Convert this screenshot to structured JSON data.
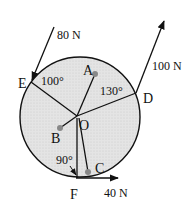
{
  "diagram": {
    "type": "force-diagram",
    "circle": {
      "cx": 80,
      "cy": 117,
      "r": 60,
      "fill": "#e6e6e6",
      "stroke": "#111111"
    },
    "center": {
      "label": "O",
      "x": 77,
      "y": 116
    },
    "points": [
      {
        "id": "A",
        "label": "A",
        "x": 95,
        "y": 74,
        "peg": true
      },
      {
        "id": "B",
        "label": "B",
        "x": 60,
        "y": 128,
        "peg": true
      },
      {
        "id": "C",
        "label": "C",
        "x": 88,
        "y": 172,
        "peg": true
      },
      {
        "id": "D",
        "label": "D",
        "x": 136,
        "y": 93,
        "peg": false
      },
      {
        "id": "E",
        "label": "E",
        "x": 31,
        "y": 82,
        "peg": false
      },
      {
        "id": "F",
        "label": "F",
        "x": 76,
        "y": 178,
        "peg": false
      }
    ],
    "forces": [
      {
        "label": "80 N",
        "at": "E",
        "from": [
          54,
          27
        ],
        "to": [
          31,
          82
        ]
      },
      {
        "label": "100 N",
        "at": "D",
        "from": [
          136,
          93
        ],
        "to": [
          164,
          20
        ]
      },
      {
        "label": "40 N",
        "at": "F",
        "from": [
          76,
          178
        ],
        "to": [
          118,
          178
        ]
      }
    ],
    "angles": [
      {
        "label": "100°",
        "at": "E"
      },
      {
        "label": "130°",
        "at": "D"
      },
      {
        "label": "90°",
        "at": "F"
      }
    ]
  },
  "labels": {
    "A": "A",
    "B": "B",
    "C": "C",
    "D": "D",
    "E": "E",
    "F": "F",
    "O": "O",
    "f80": "80 N",
    "f100": "100 N",
    "f40": "40 N",
    "a100": "100°",
    "a130": "130°",
    "a90": "90°"
  }
}
